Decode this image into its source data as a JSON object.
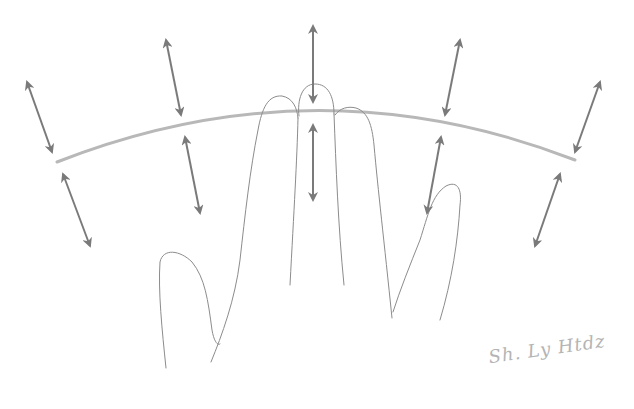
{
  "figure": {
    "colors": {
      "arc": "#b8b8b8",
      "arrows": "#7a7a7a",
      "hand": "#8c8c8c",
      "background": "#ffffff"
    },
    "arc": {
      "from": [
        57,
        162
      ],
      "control": [
        317,
        60
      ],
      "to": [
        575,
        160
      ]
    },
    "arrows_above": [
      {
        "id": "above-1",
        "x1": 27,
        "y1": 82,
        "x2": 52,
        "y2": 152
      },
      {
        "id": "above-2",
        "x1": 166,
        "y1": 40,
        "x2": 181,
        "y2": 115
      },
      {
        "id": "above-3",
        "x1": 313,
        "y1": 26,
        "x2": 313,
        "y2": 102
      },
      {
        "id": "above-4",
        "x1": 460,
        "y1": 40,
        "x2": 445,
        "y2": 115
      },
      {
        "id": "above-5",
        "x1": 600,
        "y1": 82,
        "x2": 575,
        "y2": 152
      }
    ],
    "arrows_below": [
      {
        "id": "below-1",
        "x1": 63,
        "y1": 174,
        "x2": 90,
        "y2": 246
      },
      {
        "id": "below-2",
        "x1": 185,
        "y1": 137,
        "x2": 200,
        "y2": 213
      },
      {
        "id": "below-3",
        "x1": 313,
        "y1": 125,
        "x2": 313,
        "y2": 200
      },
      {
        "id": "below-4",
        "x1": 441,
        "y1": 137,
        "x2": 427,
        "y2": 213
      },
      {
        "id": "below-5",
        "x1": 560,
        "y1": 174,
        "x2": 535,
        "y2": 246
      }
    ],
    "signature": {
      "text": "Sh. Ly Htdz"
    }
  }
}
